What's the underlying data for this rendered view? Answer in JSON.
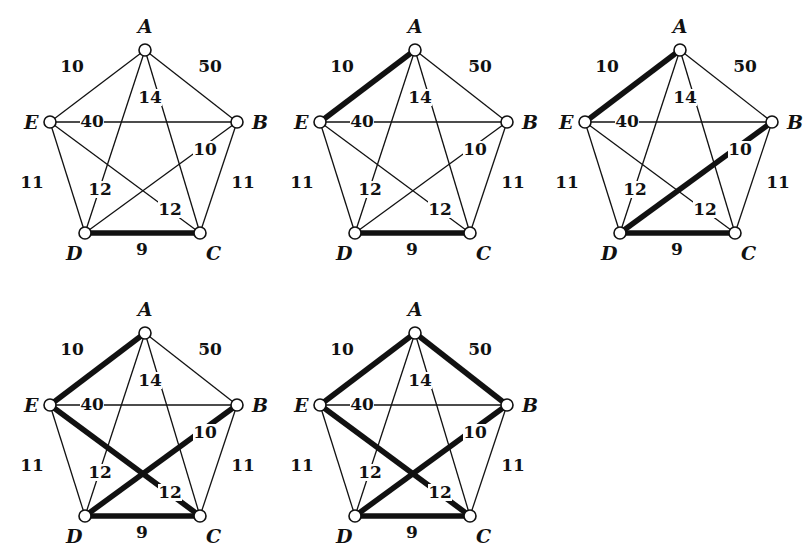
{
  "nodes": {
    "A": {
      "x": 145,
      "y": 50,
      "label": "A"
    },
    "B": {
      "x": 237,
      "y": 122,
      "label": "B"
    },
    "C": {
      "x": 200,
      "y": 233,
      "label": "C"
    },
    "D": {
      "x": 85,
      "y": 233,
      "label": "D"
    },
    "E": {
      "x": 50,
      "y": 122,
      "label": "E"
    }
  },
  "edges": [
    {
      "id": "AE",
      "from": "A",
      "to": "E",
      "weight": "10"
    },
    {
      "id": "AB",
      "from": "A",
      "to": "B",
      "weight": "50"
    },
    {
      "id": "AC",
      "from": "A",
      "to": "C",
      "weight": "14"
    },
    {
      "id": "AD",
      "from": "A",
      "to": "D",
      "weight": "12"
    },
    {
      "id": "EB",
      "from": "E",
      "to": "B",
      "weight": "40"
    },
    {
      "id": "BD",
      "from": "B",
      "to": "D",
      "weight": "10"
    },
    {
      "id": "EC",
      "from": "E",
      "to": "C",
      "weight": "12"
    },
    {
      "id": "ED",
      "from": "E",
      "to": "D",
      "weight": "11"
    },
    {
      "id": "BC",
      "from": "B",
      "to": "C",
      "weight": "11"
    },
    {
      "id": "DC",
      "from": "D",
      "to": "C",
      "weight": "9"
    }
  ],
  "graphs": [
    {
      "name": "step-1",
      "offset": [
        0,
        0
      ],
      "highlighted": [
        "DC"
      ]
    },
    {
      "name": "step-2",
      "offset": [
        270,
        0
      ],
      "highlighted": [
        "DC",
        "AE"
      ]
    },
    {
      "name": "step-3",
      "offset": [
        535,
        0
      ],
      "highlighted": [
        "DC",
        "AE",
        "BD"
      ]
    },
    {
      "name": "step-4",
      "offset": [
        0,
        283
      ],
      "highlighted": [
        "DC",
        "AE",
        "BD",
        "EC"
      ]
    },
    {
      "name": "step-5",
      "offset": [
        270,
        283
      ],
      "highlighted": [
        "DC",
        "AE",
        "BD",
        "EC",
        "AB"
      ]
    }
  ]
}
